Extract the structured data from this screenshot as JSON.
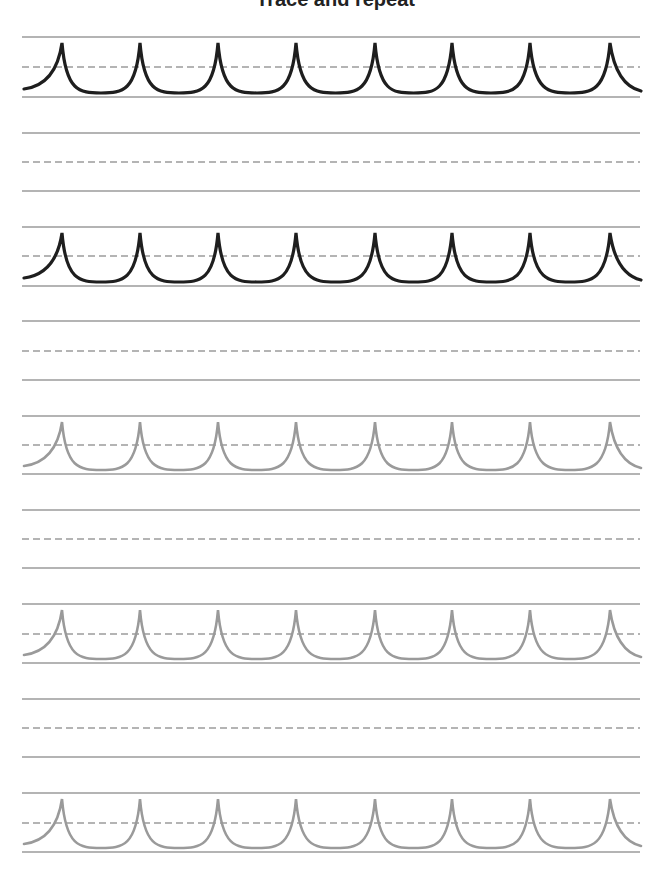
{
  "worksheet": {
    "title": "Trace and repeat",
    "colors": {
      "guide_line": "#b4b4b4",
      "dashed_line": "#b4b4b4",
      "trace_dark": "#1e1e1e",
      "trace_light": "#9a9a9a"
    },
    "line_x_start": 22,
    "line_x_end": 640,
    "peak_x": [
      62,
      140,
      218,
      296,
      375,
      452,
      530,
      610
    ],
    "rows": [
      {
        "top": 37,
        "mid": 67,
        "base": 97,
        "pattern": "dark"
      },
      {
        "top": 133,
        "mid": 162,
        "base": 191,
        "pattern": "none"
      },
      {
        "top": 227,
        "mid": 256,
        "base": 286,
        "pattern": "dark"
      },
      {
        "top": 321,
        "mid": 351,
        "base": 380,
        "pattern": "none"
      },
      {
        "top": 416,
        "mid": 445,
        "base": 474,
        "pattern": "light"
      },
      {
        "top": 510,
        "mid": 539,
        "base": 568,
        "pattern": "none"
      },
      {
        "top": 604,
        "mid": 634,
        "base": 663,
        "pattern": "light"
      },
      {
        "top": 699,
        "mid": 728,
        "base": 757,
        "pattern": "none"
      },
      {
        "top": 793,
        "mid": 823,
        "base": 852,
        "pattern": "light"
      }
    ]
  }
}
